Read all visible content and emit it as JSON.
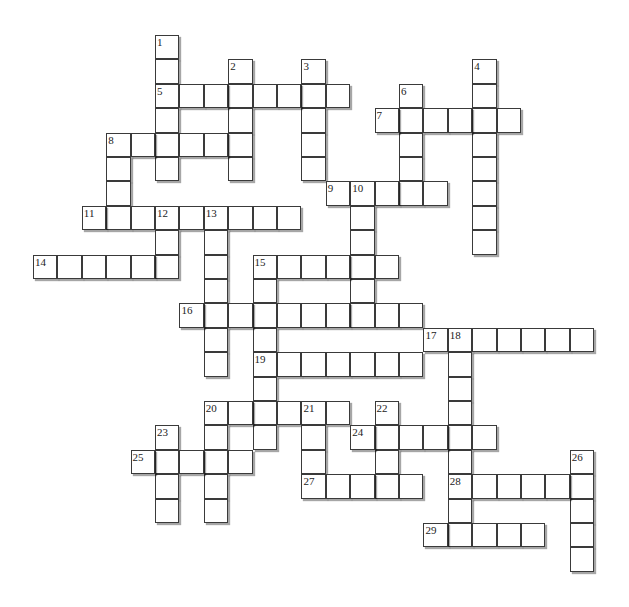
{
  "puzzle": {
    "type": "crossword",
    "grid_origin": {
      "x": 33,
      "y": 35
    },
    "cell_size": 24.4,
    "colors": {
      "background": "#ffffff",
      "cell_fill": "#ffffff",
      "cell_border": "#3a3a3a",
      "number_text": "#222222"
    },
    "entries": [
      {
        "number": 1,
        "direction": "down",
        "row": 0,
        "col": 5,
        "length": 6
      },
      {
        "number": 2,
        "direction": "down",
        "row": 1,
        "col": 8,
        "length": 5
      },
      {
        "number": 3,
        "direction": "down",
        "row": 1,
        "col": 11,
        "length": 5
      },
      {
        "number": 4,
        "direction": "down",
        "row": 1,
        "col": 18,
        "length": 8
      },
      {
        "number": 5,
        "direction": "across",
        "row": 2,
        "col": 5,
        "length": 8
      },
      {
        "number": 6,
        "direction": "down",
        "row": 2,
        "col": 15,
        "length": 5
      },
      {
        "number": 7,
        "direction": "across",
        "row": 3,
        "col": 14,
        "length": 6
      },
      {
        "number": 8,
        "direction": "across",
        "row": 4,
        "col": 3,
        "length": 6
      },
      {
        "number": 8,
        "direction": "down",
        "row": 4,
        "col": 3,
        "length": 4
      },
      {
        "number": 9,
        "direction": "across",
        "row": 6,
        "col": 12,
        "length": 5
      },
      {
        "number": 10,
        "direction": "down",
        "row": 6,
        "col": 13,
        "length": 6
      },
      {
        "number": 11,
        "direction": "across",
        "row": 7,
        "col": 2,
        "length": 9
      },
      {
        "number": 12,
        "direction": "down",
        "row": 7,
        "col": 5,
        "length": 3
      },
      {
        "number": 13,
        "direction": "down",
        "row": 7,
        "col": 7,
        "length": 7
      },
      {
        "number": 14,
        "direction": "across",
        "row": 9,
        "col": 0,
        "length": 6
      },
      {
        "number": 15,
        "direction": "across",
        "row": 9,
        "col": 9,
        "length": 6
      },
      {
        "number": 15,
        "direction": "down",
        "row": 9,
        "col": 9,
        "length": 8
      },
      {
        "number": 16,
        "direction": "across",
        "row": 11,
        "col": 6,
        "length": 10
      },
      {
        "number": 17,
        "direction": "across",
        "row": 12,
        "col": 16,
        "length": 7
      },
      {
        "number": 18,
        "direction": "down",
        "row": 12,
        "col": 17,
        "length": 9
      },
      {
        "number": 19,
        "direction": "across",
        "row": 13,
        "col": 9,
        "length": 7
      },
      {
        "number": 20,
        "direction": "across",
        "row": 15,
        "col": 7,
        "length": 6
      },
      {
        "number": 20,
        "direction": "down",
        "row": 15,
        "col": 7,
        "length": 5
      },
      {
        "number": 21,
        "direction": "down",
        "row": 15,
        "col": 11,
        "length": 4
      },
      {
        "number": 22,
        "direction": "down",
        "row": 15,
        "col": 14,
        "length": 4
      },
      {
        "number": 23,
        "direction": "down",
        "row": 16,
        "col": 5,
        "length": 4
      },
      {
        "number": 24,
        "direction": "across",
        "row": 16,
        "col": 13,
        "length": 6
      },
      {
        "number": 25,
        "direction": "across",
        "row": 17,
        "col": 4,
        "length": 5
      },
      {
        "number": 26,
        "direction": "down",
        "row": 17,
        "col": 22,
        "length": 5
      },
      {
        "number": 27,
        "direction": "across",
        "row": 18,
        "col": 11,
        "length": 5
      },
      {
        "number": 28,
        "direction": "across",
        "row": 18,
        "col": 17,
        "length": 6
      },
      {
        "number": 29,
        "direction": "across",
        "row": 20,
        "col": 16,
        "length": 5
      }
    ],
    "numbers": [
      {
        "n": "1",
        "row": 0,
        "col": 5
      },
      {
        "n": "2",
        "row": 1,
        "col": 8
      },
      {
        "n": "3",
        "row": 1,
        "col": 11
      },
      {
        "n": "4",
        "row": 1,
        "col": 18
      },
      {
        "n": "5",
        "row": 2,
        "col": 5
      },
      {
        "n": "6",
        "row": 2,
        "col": 15
      },
      {
        "n": "7",
        "row": 3,
        "col": 14
      },
      {
        "n": "8",
        "row": 4,
        "col": 3
      },
      {
        "n": "9",
        "row": 6,
        "col": 12
      },
      {
        "n": "10",
        "row": 6,
        "col": 13
      },
      {
        "n": "11",
        "row": 7,
        "col": 2
      },
      {
        "n": "12",
        "row": 7,
        "col": 5
      },
      {
        "n": "13",
        "row": 7,
        "col": 7
      },
      {
        "n": "14",
        "row": 9,
        "col": 0
      },
      {
        "n": "15",
        "row": 9,
        "col": 9
      },
      {
        "n": "16",
        "row": 11,
        "col": 6
      },
      {
        "n": "17",
        "row": 12,
        "col": 16
      },
      {
        "n": "18",
        "row": 12,
        "col": 17
      },
      {
        "n": "19",
        "row": 13,
        "col": 9
      },
      {
        "n": "20",
        "row": 15,
        "col": 7
      },
      {
        "n": "21",
        "row": 15,
        "col": 11
      },
      {
        "n": "22",
        "row": 15,
        "col": 14
      },
      {
        "n": "23",
        "row": 16,
        "col": 5
      },
      {
        "n": "24",
        "row": 16,
        "col": 13
      },
      {
        "n": "25",
        "row": 17,
        "col": 4
      },
      {
        "n": "26",
        "row": 17,
        "col": 22
      },
      {
        "n": "27",
        "row": 18,
        "col": 11
      },
      {
        "n": "28",
        "row": 18,
        "col": 17
      },
      {
        "n": "29",
        "row": 20,
        "col": 16
      }
    ]
  }
}
